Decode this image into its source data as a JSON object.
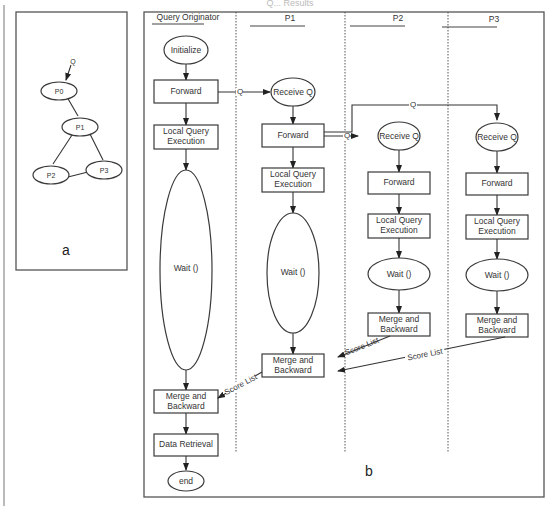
{
  "header_fragment": "Q... Results",
  "panel_a": {
    "label": "a",
    "query_label": "Q",
    "nodes": [
      "P0",
      "P1",
      "P2",
      "P3"
    ]
  },
  "panel_b": {
    "label": "b",
    "lanes": [
      "Query Originator",
      "P1",
      "P2",
      "P3"
    ],
    "originator": {
      "initialize": "Initialize",
      "forward": "Forward",
      "local_query_1": "Local Query",
      "local_query_2": "Execution",
      "wait": "Wait ()",
      "merge_1": "Merge and",
      "merge_2": "Backward",
      "data_retrieval": "Data Retrieval",
      "end": "end"
    },
    "p1": {
      "receive": "Receive Q",
      "forward": "Forward",
      "local_query_1": "Local Query",
      "local_query_2": "Execution",
      "wait": "Wait ()",
      "merge_1": "Merge and",
      "merge_2": "Backward"
    },
    "p2": {
      "receive": "Receive Q",
      "forward": "Forward",
      "local_query_1": "Local Query",
      "local_query_2": "Execution",
      "wait": "Wait ()",
      "merge_1": "Merge and",
      "merge_2": "Backward"
    },
    "p3": {
      "receive": "Receive Q",
      "forward": "Forward",
      "local_query_1": "Local Query",
      "local_query_2": "Execution",
      "wait": "Wait ()",
      "merge_1": "Merge and",
      "merge_2": "Backward"
    },
    "edge_labels": {
      "q": "Q",
      "score_list": "Score List"
    }
  }
}
